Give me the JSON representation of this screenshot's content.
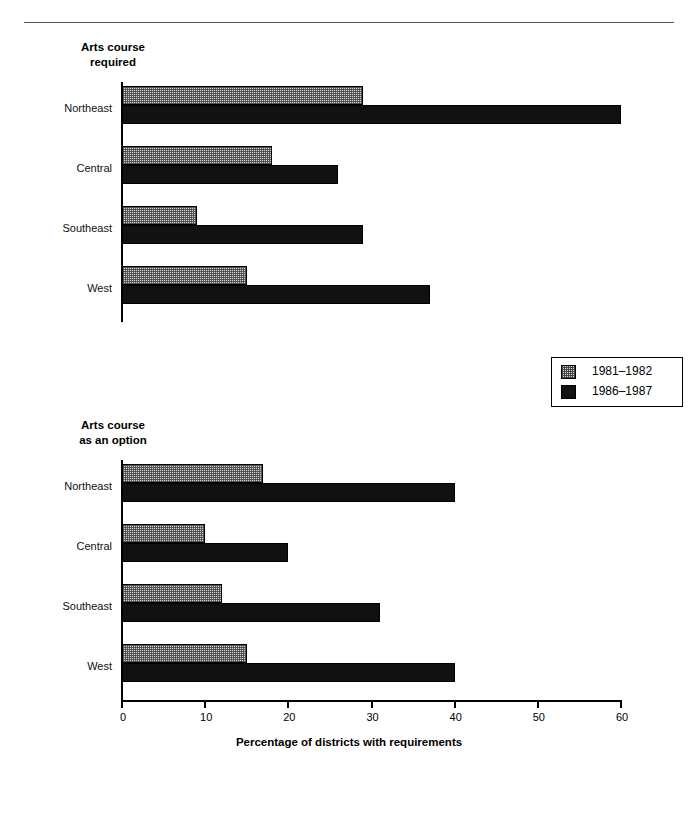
{
  "chart_data": {
    "type": "bar",
    "orientation": "horizontal",
    "title": "",
    "xlabel": "Percentage of districts with requirements",
    "ylabel": "",
    "xlim": [
      0,
      60
    ],
    "xticks": [
      0,
      10,
      20,
      30,
      40,
      50,
      60
    ],
    "grid": false,
    "legend_position": "middle-right",
    "legend": [
      "1981–1982",
      "1986–1987"
    ],
    "categories": [
      "Northeast",
      "Central",
      "Southeast",
      "West"
    ],
    "panels": [
      {
        "title": "Arts course\nrequired",
        "series": [
          {
            "name": "1981–1982",
            "values": [
              29,
              18,
              9,
              15
            ]
          },
          {
            "name": "1986–1987",
            "values": [
              60,
              26,
              29,
              37
            ]
          }
        ]
      },
      {
        "title": "Arts course\nas an option",
        "series": [
          {
            "name": "1981–1982",
            "values": [
              17,
              10,
              12,
              15
            ]
          },
          {
            "name": "1986–1987",
            "values": [
              40,
              20,
              31,
              40
            ]
          }
        ]
      }
    ]
  },
  "legend": {
    "items": [
      {
        "label": "1981–1982",
        "style": "hatched-gray",
        "color": "#d3d3d3"
      },
      {
        "label": "1986–1987",
        "style": "solid-black",
        "color": "#111111"
      }
    ]
  },
  "axis": {
    "title": "Percentage of districts with requirements",
    "tick_labels": [
      "0",
      "10",
      "20",
      "30",
      "40",
      "50",
      "60"
    ]
  },
  "panel_required": {
    "title": "Arts course\nrequired",
    "groups": [
      {
        "label": "Northeast",
        "a": 29,
        "b": 60
      },
      {
        "label": "Central",
        "a": 18,
        "b": 26
      },
      {
        "label": "Southeast",
        "a": 9,
        "b": 29
      },
      {
        "label": "West",
        "a": 15,
        "b": 37
      }
    ]
  },
  "panel_option": {
    "title": "Arts course\nas an option",
    "groups": [
      {
        "label": "Northeast",
        "a": 17,
        "b": 40
      },
      {
        "label": "Central",
        "a": 10,
        "b": 20
      },
      {
        "label": "Southeast",
        "a": 12,
        "b": 31
      },
      {
        "label": "West",
        "a": 15,
        "b": 40
      }
    ]
  }
}
